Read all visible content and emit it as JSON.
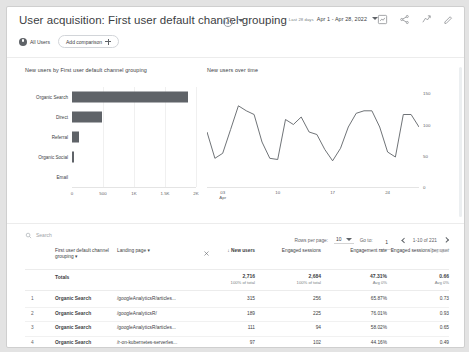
{
  "header": {
    "title": "User acquisition: First user default channel grouping",
    "title_check_icon": "check-circle-icon",
    "title_caret_icon": "chevron-down-icon",
    "date_range_lead": "Last 28 days",
    "date_range": "Apr 1 - Apr 28, 2022",
    "date_caret_icon": "chevron-down-icon",
    "icons": [
      {
        "name": "insights-icon",
        "glyph": "insights"
      },
      {
        "name": "share-icon",
        "glyph": "share"
      },
      {
        "name": "compare-icon",
        "glyph": "compare"
      },
      {
        "name": "edit-icon",
        "glyph": "edit"
      }
    ]
  },
  "chips": {
    "all_users_icon": "audience-dot-icon",
    "all_users": "All Users",
    "add_comparison": "Add comparison",
    "add_icon": "plus-icon"
  },
  "charts": {
    "bar": {
      "title": "New users by First user default channel grouping"
    },
    "line": {
      "title": "New users over time"
    }
  },
  "chart_data": [
    {
      "type": "bar",
      "title": "New users by First user default channel grouping",
      "orientation": "horizontal",
      "categories": [
        "Organic Search",
        "Direct",
        "Referral",
        "Organic Social",
        "Email"
      ],
      "values": [
        1870,
        480,
        120,
        40,
        0
      ],
      "xlabel": "",
      "ylabel": "",
      "xlim": [
        0,
        2000
      ],
      "xticks": [
        0,
        500,
        1000,
        1500,
        2000
      ],
      "xticklabels": [
        "0",
        "500",
        "1K",
        "1.5K",
        "2K"
      ],
      "grid": true,
      "series_color": "#5f6368",
      "legend": "none"
    },
    {
      "type": "line",
      "title": "New users over time",
      "xlabel": "",
      "ylabel": "",
      "ylim": [
        0,
        160
      ],
      "yticks": [
        0,
        50,
        100,
        150
      ],
      "yticklabels": [
        "0",
        "50",
        "100",
        "150"
      ],
      "yaxis_position": "right",
      "xticks": [
        3,
        10,
        17,
        24
      ],
      "xticklabels": [
        "03",
        "10",
        "17",
        "24"
      ],
      "xtick_sublabel": "Apr",
      "grid": false,
      "line_color": "#5f6368",
      "x": [
        1,
        2,
        3,
        4,
        5,
        6,
        7,
        8,
        9,
        10,
        11,
        12,
        13,
        14,
        15,
        16,
        17,
        18,
        19,
        20,
        21,
        22,
        23,
        24,
        25,
        26,
        27,
        28
      ],
      "values": [
        88,
        46,
        54,
        92,
        130,
        122,
        116,
        72,
        46,
        44,
        108,
        100,
        112,
        88,
        84,
        60,
        42,
        62,
        96,
        118,
        122,
        122,
        96,
        56,
        48,
        116,
        116,
        96
      ]
    }
  ],
  "table": {
    "search_icon": "search-icon",
    "search_placeholder": "Search",
    "rows_per_page_label": "Rows per page:",
    "rows_per_page_value": "10",
    "rows_per_page_caret": "chevron-down-icon",
    "go_to_label": "Go to:",
    "go_to_value": "1",
    "range_label": "1-10 of 221",
    "prev_icon": "chevron-left-icon",
    "next_icon": "chevron-right-icon",
    "remove_column_icon": "close-icon",
    "dimension_headers": [
      {
        "label": "First user default channel grouping",
        "caret": "▾"
      },
      {
        "label": "Landing page",
        "caret": "▾"
      }
    ],
    "metric_headers": [
      {
        "label": "New users",
        "sort": "↓",
        "active": true
      },
      {
        "label": "Engaged sessions",
        "sort": "",
        "active": false
      },
      {
        "label": "Engagement rate",
        "sort": "",
        "active": false
      },
      {
        "label": "Engaged sessions per user",
        "sort": "",
        "active": false
      },
      {
        "label": "Engaged",
        "sort": "",
        "active": false
      }
    ],
    "totals": {
      "label": "Totals",
      "cells": [
        {
          "value": "2,716",
          "sub": "100% of total"
        },
        {
          "value": "2,684",
          "sub": "100% of total"
        },
        {
          "value": "47.31%",
          "sub": "Avg 0%"
        },
        {
          "value": "0.66",
          "sub": "Avg 0%"
        }
      ]
    },
    "rows": [
      {
        "index": "1",
        "channel": "Organic Search",
        "landing_page": "/googleAnalyticsR/articles...",
        "new_users": "315",
        "engaged_sessions": "256",
        "engagement_rate": "65.87%",
        "engaged_per_user": "0.73"
      },
      {
        "index": "2",
        "channel": "Organic Search",
        "landing_page": "/googleAnalyticsR/",
        "new_users": "189",
        "engaged_sessions": "225",
        "engagement_rate": "76.01%",
        "engaged_per_user": "0.93"
      },
      {
        "index": "3",
        "channel": "Organic Search",
        "landing_page": "/googleAnalyticsR/articles...",
        "new_users": "111",
        "engaged_sessions": "94",
        "engagement_rate": "58.02%",
        "engaged_per_user": "0.65"
      },
      {
        "index": "4",
        "channel": "Organic Search",
        "landing_page": "/r-on-kubernetes-serverles...",
        "new_users": "97",
        "engaged_sessions": "102",
        "engagement_rate": "44.16%",
        "engaged_per_user": "0.49"
      }
    ]
  }
}
